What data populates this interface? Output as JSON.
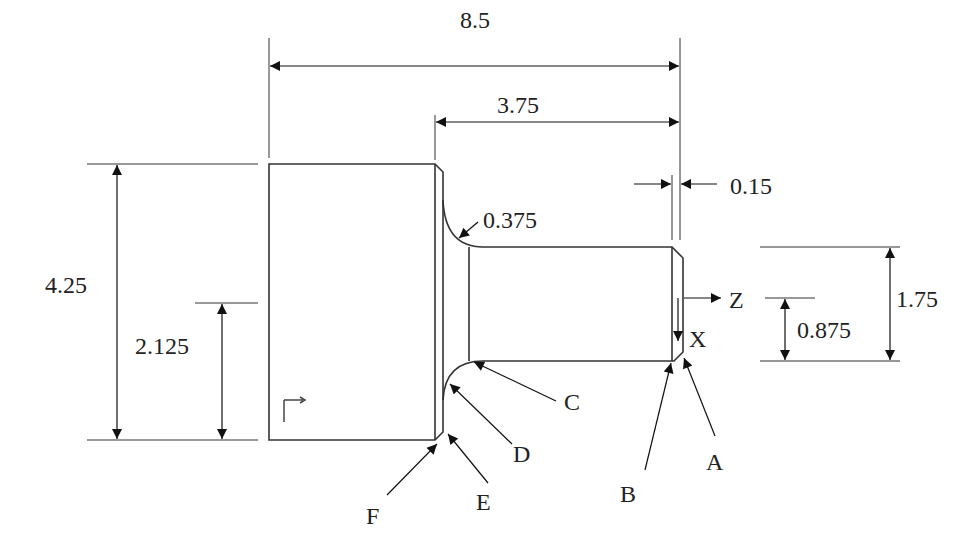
{
  "colors": {
    "line": "#333333",
    "text": "#222222",
    "background": "#ffffff"
  },
  "dimensions": {
    "overall_length": "8.5",
    "shaft_length": "3.75",
    "chamfer_width": "0.15",
    "fillet_radius": "0.375",
    "shaft_diameter": "1.75",
    "shaft_radius": "0.875",
    "flange_diameter": "4.25",
    "flange_radius": "2.125"
  },
  "axes": {
    "z_label": "Z",
    "x_label": "X"
  },
  "points": [
    {
      "id": "A",
      "label": "A"
    },
    {
      "id": "B",
      "label": "B"
    },
    {
      "id": "C",
      "label": "C"
    },
    {
      "id": "D",
      "label": "D"
    },
    {
      "id": "E",
      "label": "E"
    },
    {
      "id": "F",
      "label": "F"
    }
  ]
}
